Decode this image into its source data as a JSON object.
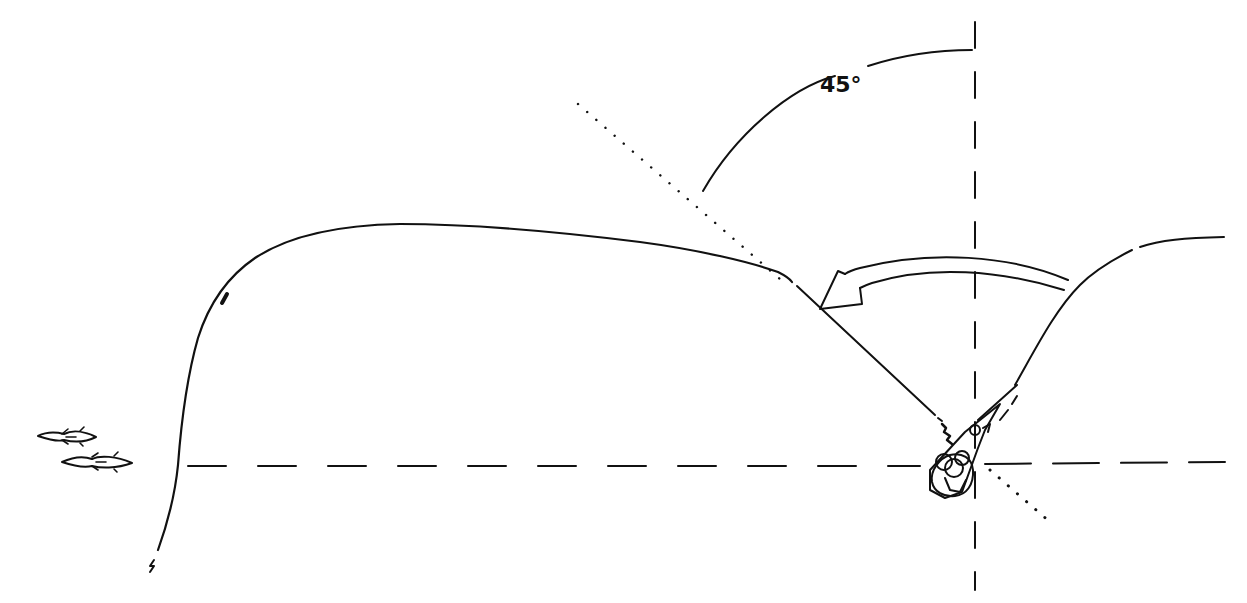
{
  "diagram": {
    "angle_label": "45°",
    "colors": {
      "background": "#ffffff",
      "ink": "#111111"
    },
    "elements": {
      "vertical_axis": "dashed vertical reference line through angler",
      "horizontal_axis": "dashed horizontal reference line (shoreline/water level)",
      "diagonal_45": "dotted 45-degree line through angler",
      "cast_line": "curved fishing line path from rod to far left",
      "cast_arrow": "curved double-line arrow showing rod sweep direction",
      "angle_arc": "arc marking 45-degree angle",
      "angler": "top-down figure of angler with rod",
      "fish": "two fish swimming toward the right"
    }
  }
}
